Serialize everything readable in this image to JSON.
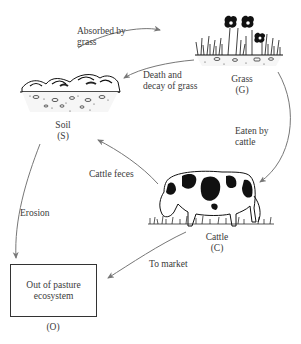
{
  "diagram": {
    "type": "nutrient-cycle",
    "nodes": [
      {
        "id": "S",
        "name": "Soil",
        "code": "(S)"
      },
      {
        "id": "G",
        "name": "Grass",
        "code": "(G)"
      },
      {
        "id": "C",
        "name": "Cattle",
        "code": "(C)"
      },
      {
        "id": "O",
        "name": "Out of pasture ecosystem",
        "code": "(O)"
      }
    ],
    "edges": [
      {
        "from": "S",
        "to": "G",
        "label_line1": "Absorbed by",
        "label_line2": "grass"
      },
      {
        "from": "G",
        "to": "S",
        "label_line1": "Death and",
        "label_line2": "decay of grass"
      },
      {
        "from": "G",
        "to": "C",
        "label_line1": "Eaten by",
        "label_line2": "cattle"
      },
      {
        "from": "C",
        "to": "S",
        "label_line1": "Cattle feces"
      },
      {
        "from": "S",
        "to": "O",
        "label_line1": "Erosion"
      },
      {
        "from": "C",
        "to": "O",
        "label_line1": "To market"
      }
    ],
    "box_o": {
      "line1": "Out of pasture",
      "line2": "ecosystem"
    },
    "colors": {
      "arrow": "#777777",
      "text": "#3a3a3a",
      "ink": "#111111"
    }
  }
}
